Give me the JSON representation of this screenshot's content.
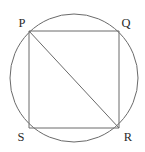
{
  "figure": {
    "canvas": {
      "width": 145,
      "height": 152,
      "background": "#ffffff"
    },
    "stroke_color": "#6a6a6a",
    "label_color": "#2b2b2b",
    "stroke_width": 1,
    "circle": {
      "name": "circumscribed-circle",
      "cx": 74,
      "cy": 78,
      "r": 64
    },
    "vertices": [
      {
        "id": "P",
        "label": "P",
        "x": 29,
        "y": 31,
        "label_x": 22,
        "label_y": 27
      },
      {
        "id": "Q",
        "label": "Q",
        "x": 119,
        "y": 31,
        "label_x": 126,
        "label_y": 27
      },
      {
        "id": "R",
        "label": "R",
        "x": 119,
        "y": 128,
        "label_x": 128,
        "label_y": 141
      },
      {
        "id": "S",
        "label": "S",
        "x": 29,
        "y": 128,
        "label_x": 21,
        "label_y": 141
      }
    ],
    "edges": [
      {
        "name": "edge-pq",
        "from": "P",
        "to": "Q",
        "x1": 29,
        "y1": 31,
        "x2": 119,
        "y2": 31
      },
      {
        "name": "edge-qr",
        "from": "Q",
        "to": "R",
        "x1": 119,
        "y1": 31,
        "x2": 119,
        "y2": 128
      },
      {
        "name": "edge-rs",
        "from": "R",
        "to": "S",
        "x1": 119,
        "y1": 128,
        "x2": 29,
        "y2": 128
      },
      {
        "name": "edge-sp",
        "from": "S",
        "to": "P",
        "x1": 29,
        "y1": 128,
        "x2": 29,
        "y2": 31
      }
    ],
    "diagonals": [
      {
        "name": "diagonal-pr",
        "from": "P",
        "to": "R",
        "x1": 29,
        "y1": 31,
        "x2": 119,
        "y2": 128
      }
    ]
  }
}
